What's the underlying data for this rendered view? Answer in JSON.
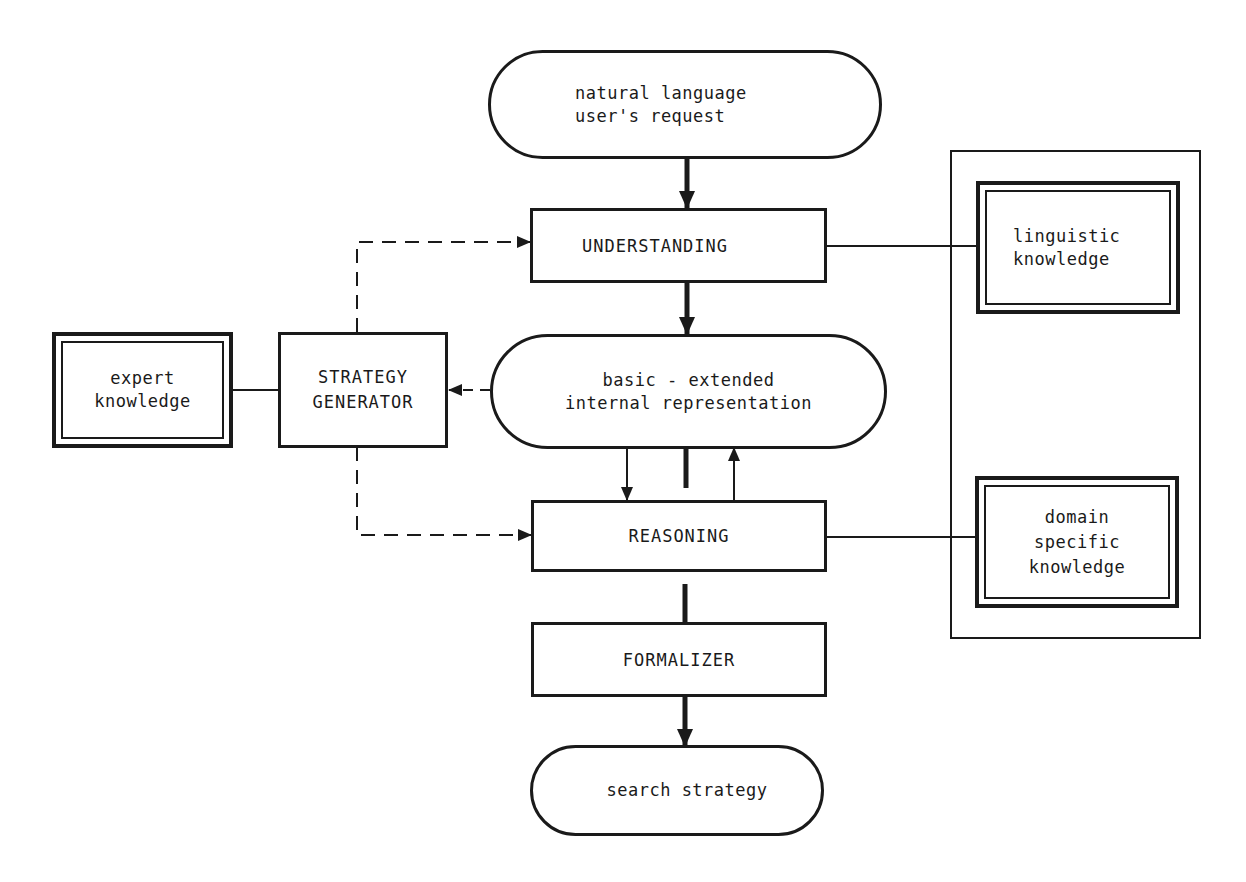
{
  "diagram": {
    "nodes": {
      "request": {
        "label": "natural language\nuser's  request",
        "shape": "terminator"
      },
      "understanding": {
        "label": "UNDERSTANDING",
        "shape": "process"
      },
      "representation": {
        "label": "basic - extended\ninternal representation",
        "shape": "terminator"
      },
      "reasoning": {
        "label": "REASONING",
        "shape": "process"
      },
      "formalizer": {
        "label": "FORMALIZER",
        "shape": "process"
      },
      "search_strategy": {
        "label": "search strategy",
        "shape": "terminator"
      },
      "strategy_generator": {
        "label": "STRATEGY\nGENERATOR",
        "shape": "process"
      },
      "expert_knowledge": {
        "label": "expert\nknowledge",
        "shape": "knowledge-base"
      },
      "linguistic_knowledge": {
        "label": "linguistic\nknowledge",
        "shape": "knowledge-base"
      },
      "domain_knowledge": {
        "label": "domain\nspecific\nknowledge",
        "shape": "knowledge-base"
      }
    },
    "edges": [
      {
        "from": "request",
        "to": "understanding",
        "style": "thick-arrow"
      },
      {
        "from": "understanding",
        "to": "representation",
        "style": "thick-arrow"
      },
      {
        "from": "representation",
        "to": "reasoning",
        "style": "thin-arrow"
      },
      {
        "from": "reasoning",
        "to": "representation",
        "style": "thin-arrow"
      },
      {
        "from": "reasoning",
        "to": "formalizer",
        "style": "thick-line"
      },
      {
        "from": "formalizer",
        "to": "search_strategy",
        "style": "thick-arrow"
      },
      {
        "from": "representation",
        "to": "strategy_generator",
        "style": "dashed-arrow"
      },
      {
        "from": "strategy_generator",
        "to": "understanding",
        "style": "dashed-arrow"
      },
      {
        "from": "strategy_generator",
        "to": "reasoning",
        "style": "dashed-arrow"
      },
      {
        "from": "expert_knowledge",
        "to": "strategy_generator",
        "style": "line"
      },
      {
        "from": "understanding",
        "to": "linguistic_knowledge",
        "style": "line"
      },
      {
        "from": "reasoning",
        "to": "domain_knowledge",
        "style": "line"
      }
    ],
    "colors": {
      "ink": "#1a1a1a",
      "paper": "#ffffff"
    }
  }
}
